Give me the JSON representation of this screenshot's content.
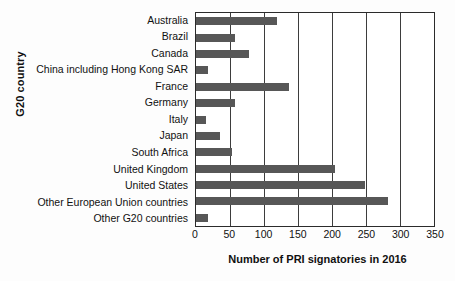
{
  "chart_data": {
    "type": "bar",
    "orientation": "horizontal",
    "title": "",
    "xlabel": "Number of PRI signatories in 2016",
    "ylabel": "G20 country",
    "xlim": [
      0,
      350
    ],
    "xticks": [
      0,
      50,
      100,
      150,
      200,
      250,
      300,
      350
    ],
    "grid": "vertical",
    "legend": "none",
    "bar_color": "#575757",
    "categories": [
      "Australia",
      "Brazil",
      "Canada",
      "China including Hong Kong SAR",
      "France",
      "Germany",
      "Italy",
      "Japan",
      "South Africa",
      "United Kingdom",
      "United States",
      "Other European Union countries",
      "Other G20 countries"
    ],
    "values": [
      119,
      58,
      78,
      17,
      137,
      57,
      14,
      36,
      53,
      205,
      249,
      282,
      17
    ]
  }
}
